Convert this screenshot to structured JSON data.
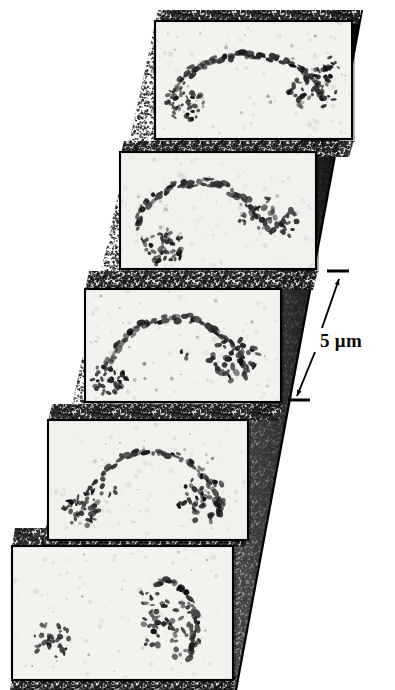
{
  "figure": {
    "type": "micrograph-z-stack",
    "panel_count": 5,
    "background_color": "#ffffff",
    "panel_fill": "#f2f1ee",
    "panel_border_color": "#000000",
    "stipple_color": "#2a2a2a",
    "wedge_shadow_color": "#111111",
    "specimen_color": "#1a1a1a"
  },
  "scale_bar": {
    "label": "5 μm",
    "value": 5,
    "unit": "μm",
    "style": "double-headed-arrow-with-end-ticks",
    "tick_color": "#000000",
    "label_color": "#0a0a0a"
  },
  "panels": [
    {
      "index": 1,
      "name": "optical-section-1",
      "x": 155,
      "y": 21,
      "w": 197,
      "h": 118,
      "shade": "#f3f2ef",
      "specimen": {
        "arc": {
          "cx": 0.47,
          "cy": 0.78,
          "rx": 0.4,
          "ry": 0.5,
          "a0": 205,
          "a1": 345,
          "thick": 4.6,
          "density": 62
        },
        "clusters": [
          {
            "cx": 0.15,
            "cy": 0.7,
            "r": 0.085,
            "n": 46,
            "size": 3.3
          },
          {
            "cx": 0.8,
            "cy": 0.58,
            "r": 0.105,
            "n": 40,
            "size": 3.9
          },
          {
            "cx": 0.88,
            "cy": 0.4,
            "r": 0.055,
            "n": 14,
            "size": 3.2
          }
        ],
        "specks": 26
      }
    },
    {
      "index": 2,
      "name": "optical-section-2",
      "x": 120,
      "y": 152,
      "w": 196,
      "h": 117,
      "shade": "#f2f1ee",
      "specimen": {
        "arc": {
          "cx": 0.4,
          "cy": 0.82,
          "rx": 0.34,
          "ry": 0.56,
          "a0": 200,
          "a1": 332,
          "thick": 5.2,
          "density": 60
        },
        "clusters": [
          {
            "cx": 0.22,
            "cy": 0.8,
            "r": 0.095,
            "n": 48,
            "size": 3.6
          },
          {
            "cx": 0.79,
            "cy": 0.57,
            "r": 0.105,
            "n": 34,
            "size": 4.2
          },
          {
            "cx": 0.62,
            "cy": 0.56,
            "r": 0.03,
            "n": 5,
            "size": 3.0
          }
        ],
        "specks": 22
      }
    },
    {
      "index": 3,
      "name": "optical-section-3",
      "x": 85,
      "y": 289,
      "w": 196,
      "h": 113,
      "shade": "#f3f2ef",
      "specimen": {
        "arc": {
          "cx": 0.46,
          "cy": 0.86,
          "rx": 0.37,
          "ry": 0.6,
          "a0": 198,
          "a1": 348,
          "thick": 5.0,
          "density": 58
        },
        "clusters": [
          {
            "cx": 0.12,
            "cy": 0.8,
            "r": 0.08,
            "n": 40,
            "size": 3.5
          },
          {
            "cx": 0.76,
            "cy": 0.62,
            "r": 0.11,
            "n": 42,
            "size": 4.0
          },
          {
            "cx": 0.5,
            "cy": 0.58,
            "r": 0.025,
            "n": 4,
            "size": 3.0
          }
        ],
        "specks": 24
      }
    },
    {
      "index": 4,
      "name": "optical-section-4",
      "x": 48,
      "y": 420,
      "w": 200,
      "h": 120,
      "shade": "#f2f1ee",
      "specimen": {
        "arc": {
          "cx": 0.52,
          "cy": 0.88,
          "rx": 0.34,
          "ry": 0.62,
          "a0": 205,
          "a1": 350,
          "thick": 4.4,
          "density": 50
        },
        "clusters": [
          {
            "cx": 0.16,
            "cy": 0.74,
            "r": 0.085,
            "n": 42,
            "size": 3.6
          },
          {
            "cx": 0.78,
            "cy": 0.66,
            "r": 0.115,
            "n": 46,
            "size": 3.9
          },
          {
            "cx": 0.3,
            "cy": 0.58,
            "r": 0.035,
            "n": 7,
            "size": 3.1
          }
        ],
        "specks": 25
      }
    },
    {
      "index": 5,
      "name": "optical-section-5",
      "x": 12,
      "y": 546,
      "w": 221,
      "h": 134,
      "shade": "#f3f2ef",
      "specimen": {
        "arc": {
          "cx": 0.7,
          "cy": 0.62,
          "rx": 0.13,
          "ry": 0.36,
          "a0": 250,
          "a1": 395,
          "thick": 4.2,
          "density": 34
        },
        "clusters": [
          {
            "cx": 0.18,
            "cy": 0.7,
            "r": 0.075,
            "n": 34,
            "size": 3.5
          },
          {
            "cx": 0.72,
            "cy": 0.62,
            "r": 0.12,
            "n": 52,
            "size": 3.8
          },
          {
            "cx": 0.62,
            "cy": 0.38,
            "r": 0.04,
            "n": 9,
            "size": 3.2
          }
        ],
        "specks": 18
      }
    }
  ],
  "stipple_bands": [
    {
      "name": "stipple-band-top",
      "x1": 163,
      "y1": 10,
      "x2": 362,
      "y2": 10,
      "x3": 358,
      "y3": 24,
      "x4": 158,
      "y4": 24
    },
    {
      "name": "stipple-band-1",
      "x1": 124,
      "y1": 141,
      "x2": 354,
      "y2": 141,
      "x3": 349,
      "y3": 157,
      "x4": 120,
      "y4": 157
    },
    {
      "name": "stipple-band-2",
      "x1": 89,
      "y1": 271,
      "x2": 318,
      "y2": 271,
      "x3": 313,
      "y3": 290,
      "x4": 85,
      "y4": 290
    },
    {
      "name": "stipple-band-3",
      "x1": 52,
      "y1": 404,
      "x2": 283,
      "y2": 404,
      "x3": 278,
      "y3": 421,
      "x4": 48,
      "y4": 421
    },
    {
      "name": "stipple-band-4",
      "x1": 15,
      "y1": 528,
      "x2": 250,
      "y2": 528,
      "x3": 245,
      "y3": 547,
      "x4": 12,
      "y4": 547
    },
    {
      "name": "stipple-band-bottom",
      "x1": 14,
      "y1": 676,
      "x2": 236,
      "y2": 676,
      "x3": 232,
      "y3": 690,
      "x4": 10,
      "y4": 690
    }
  ],
  "arrow": {
    "tick_top": {
      "x1": 327,
      "y1": 271,
      "x2": 349,
      "y2": 271
    },
    "tick_bottom": {
      "x1": 288,
      "y1": 400,
      "x2": 310,
      "y2": 400
    },
    "shaft_upper": {
      "x1": 322,
      "y1": 328,
      "x2": 339,
      "y2": 279
    },
    "shaft_lower": {
      "x1": 315,
      "y1": 352,
      "x2": 297,
      "y2": 396
    },
    "label_x": 320,
    "label_y": 331
  }
}
